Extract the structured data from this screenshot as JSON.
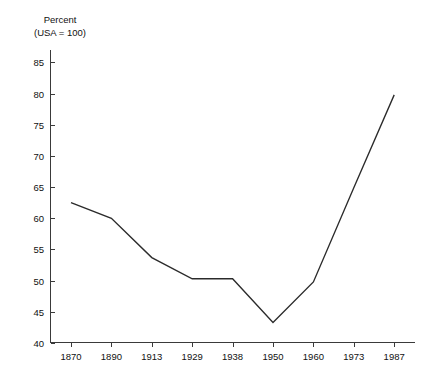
{
  "chart_data": {
    "type": "line",
    "title": "",
    "axis_title_lines": [
      "Percent",
      "(USA = 100)"
    ],
    "ylabel": "Percent (USA = 100)",
    "xlabel": "",
    "categories": [
      "1870",
      "1890",
      "1913",
      "1929",
      "1938",
      "1950",
      "1960",
      "1973",
      "1987"
    ],
    "values": [
      62.5,
      60.0,
      53.7,
      50.3,
      50.3,
      43.3,
      49.8,
      64.9,
      79.8
    ],
    "series": [
      {
        "name": "Percent (USA = 100)",
        "values": [
          62.5,
          60.0,
          53.7,
          50.3,
          50.3,
          43.3,
          49.8,
          64.9,
          79.8
        ]
      }
    ],
    "ylim": [
      40,
      87
    ],
    "yticks": [
      40,
      45,
      50,
      55,
      60,
      65,
      70,
      75,
      80,
      85
    ],
    "ytick_labels": [
      "40",
      "45",
      "50",
      "55",
      "60",
      "65",
      "70",
      "75",
      "80",
      "85"
    ],
    "xtick_labels": [
      "1870",
      "1890",
      "1913",
      "1929",
      "1938",
      "1950",
      "1960",
      "1973",
      "1987"
    ],
    "grid": false,
    "legend": false,
    "legend_position": "none",
    "markers": false,
    "line_color": "#2b2b2b",
    "axis_color": "#3a3a3a",
    "background_color": "#ffffff"
  }
}
